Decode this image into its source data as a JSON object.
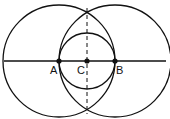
{
  "diagram": {
    "points": [
      {
        "name": "A",
        "x": 59,
        "y": 61
      },
      {
        "name": "C",
        "x": 87,
        "y": 61
      },
      {
        "name": "B",
        "x": 115,
        "y": 61
      }
    ],
    "labels": {
      "A": "A",
      "B": "B",
      "C": "C"
    },
    "circles": [
      {
        "center": "A",
        "radius": 56
      },
      {
        "center": "B",
        "radius": 56
      },
      {
        "center": "C",
        "radius": 28
      }
    ],
    "line": {
      "x1": 4,
      "x2": 166,
      "y": 61
    },
    "dashed_line": {
      "x": 87,
      "y1": 8,
      "y2": 114
    },
    "stroke_color": "#111111"
  }
}
